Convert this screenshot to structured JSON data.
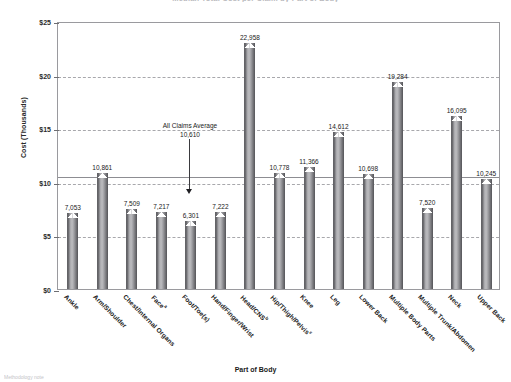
{
  "chart_data": {
    "type": "bar",
    "title": "Median Total Cost per Claim by Part of Body",
    "xlabel": "Part of Body",
    "ylabel": "Cost (Thousands)",
    "ylim": [
      0,
      25000
    ],
    "ytick_labels": [
      "$0",
      "$5",
      "$10",
      "$15",
      "$20",
      "$25"
    ],
    "ytick_values": [
      0,
      5000,
      10000,
      15000,
      20000,
      25000
    ],
    "grid": "horizontal-dashed",
    "legend": "none",
    "categories": [
      "Ankle",
      "Arm/Shoulder",
      "Chest/Internal Organs",
      "Face",
      "Foot/Toe(s)",
      "Hand/Finger/Wrist",
      "Head/CNS",
      "Hip/Thigh/Pelvis",
      "Knee",
      "Leg",
      "Lower Back",
      "Multiple Body Parts",
      "Multiple Trunk/Abdomen",
      "Neck",
      "Upper Back"
    ],
    "category_superscripts": [
      "",
      "",
      "",
      "a",
      "",
      "",
      "b",
      "c",
      "",
      "",
      "",
      "",
      "",
      "",
      ""
    ],
    "values": [
      7053,
      10861,
      7509,
      7217,
      6301,
      7222,
      22958,
      10778,
      11366,
      14612,
      10698,
      19284,
      7520,
      16095,
      10245
    ],
    "value_labels": [
      "7,053",
      "10,861",
      "7,509",
      "7,217",
      "6,301",
      "7,222",
      "22,958",
      "10,778",
      "11,366",
      "14,612",
      "10,698",
      "19,284",
      "7,520",
      "16,095",
      "10,245"
    ],
    "reference_line": {
      "label": "All Claims Average",
      "value": 10610,
      "value_label": "10,610"
    },
    "colors": {
      "bar_dark": "#5f5f63",
      "bar_light": "#bdbdc0",
      "gridline": "#a8a8ac",
      "frame": "#9a9a9e",
      "reference_line": "#8d8d92"
    }
  },
  "footnote": "Methodology note"
}
